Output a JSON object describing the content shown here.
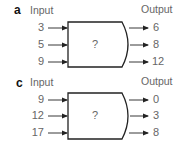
{
  "panels": [
    {
      "label": "a",
      "input_header": "Input",
      "output_header": "Output",
      "box_label": "?",
      "inputs": [
        "3",
        "5",
        "9"
      ],
      "outputs": [
        "6",
        "8",
        "12"
      ]
    },
    {
      "label": "c",
      "input_header": "Input",
      "output_header": "Output",
      "box_label": "?",
      "inputs": [
        "9",
        "12",
        "17"
      ],
      "outputs": [
        "0",
        "3",
        "8"
      ]
    }
  ]
}
